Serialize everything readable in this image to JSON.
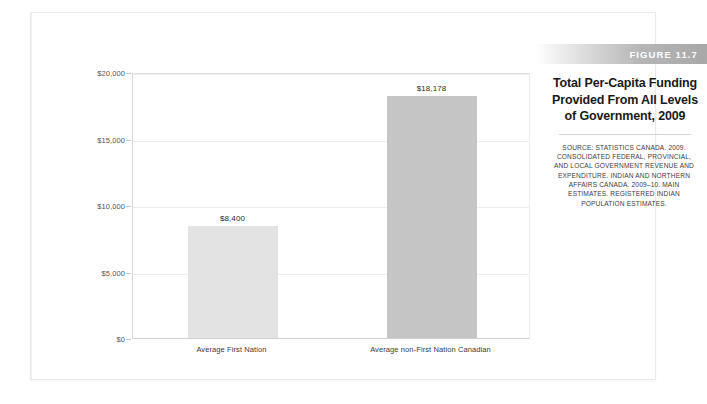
{
  "figure": {
    "band_label": "FIGURE 11.7",
    "title": "Total Per-Capita Funding Provided From All Levels of Government, 2009",
    "source": "SOURCE: STATISTICS CANADA. 2009. CONSOLIDATED FEDERAL, PROVINCIAL, AND LOCAL GOVERNMENT REVENUE AND EXPENDITURE. INDIAN AND NORTHERN AFFAIRS CANADA. 2009–10. MAIN ESTIMATES. REGISTERED INDIAN POPULATION ESTIMATES."
  },
  "colors": {
    "bar_first_nation": "#e3e3e3",
    "bar_non_first_nation": "#c5c5c5",
    "gridline": "#ededed",
    "axis": "#d0d0d0",
    "band_end": "#a8a8a8"
  },
  "chart_data": {
    "type": "bar",
    "title": "Total Per-Capita Funding Provided From All Levels of Government, 2009",
    "xlabel": "",
    "ylabel": "",
    "categories": [
      "Average First Nation",
      "Average non-First Nation Canadian"
    ],
    "values": [
      8400,
      18178
    ],
    "value_labels": [
      "$8,400",
      "$18,178"
    ],
    "bar_colors": [
      "#e3e3e3",
      "#c5c5c5"
    ],
    "ylim": [
      0,
      20000
    ],
    "yticks": [
      0,
      5000,
      10000,
      15000,
      20000
    ],
    "ytick_labels": [
      "$0",
      "$5,000",
      "$10,000",
      "$15,000",
      "$20,000"
    ],
    "grid": true,
    "legend": false
  }
}
